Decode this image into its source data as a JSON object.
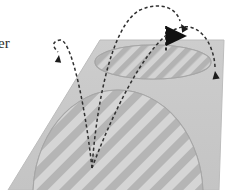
{
  "figure": {
    "title_fragment": "er",
    "canvas": {
      "width": 243,
      "height": 190
    },
    "colors": {
      "background": "#ffffff",
      "plane_fill": "#c9c9c9",
      "plane_edge": "#b0b0b0",
      "ellipse_fill": "#c2c2c2",
      "ellipse_outline": "#a9a9a9",
      "stripe_light": "#d4d4d4",
      "stripe_dark": "#b2b2b2",
      "trajectory_stroke": "#303030",
      "flag_fill": "#111111",
      "text": "#2b2b2b"
    },
    "plane": {
      "name": "ground-plane",
      "points": "100,40 224,40 219,190 8,190",
      "note": "tilted quadrilateral ground surface"
    },
    "regions": [
      {
        "name": "upper-target-ellipse",
        "shape": "ellipse",
        "cx": 153,
        "cy": 62,
        "rx": 58,
        "ry": 17,
        "stripe_angle_deg": 45,
        "stripe_spacing": 11
      },
      {
        "name": "lower-target-dome",
        "shape": "dome",
        "cx": 118,
        "cy": 195,
        "rx": 85,
        "ry": 105,
        "stripe_angle_deg": 45,
        "stripe_spacing": 15
      }
    ],
    "trajectories": [
      {
        "name": "trajectory-left-short",
        "path": "M 92,168 C 84,96 70,38 60,40 C 50,42 54,48 58,52",
        "arrow_at": {
          "x": 59,
          "y": 54
        },
        "arrow_angle_deg": 110,
        "label": "short hop"
      },
      {
        "name": "trajectory-middle-high",
        "path": "M 92,168 C 96,110 110,26 140,10 C 163,0 177,10 180,21",
        "arrow_at": {
          "x": 181,
          "y": 23
        },
        "arrow_angle_deg": 70,
        "label": "high arc"
      },
      {
        "name": "trajectory-right-long",
        "path": "M 92,168 C 110,120 142,50 172,31 C 198,16 214,44 215,67",
        "arrow_at": {
          "x": 215,
          "y": 70
        },
        "arrow_angle_deg": 88,
        "label": "long carry"
      }
    ],
    "launch_point": {
      "name": "launch-origin",
      "x": 92,
      "y": 168
    },
    "flag": {
      "name": "pennant-flag-marker",
      "pole_x": 166,
      "pole_top": 26,
      "pole_bottom": 52,
      "pennant_points": "166,27 186,36 166,45",
      "label": "target flag"
    }
  }
}
